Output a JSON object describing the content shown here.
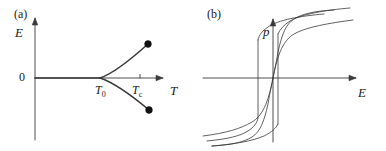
{
  "figure": {
    "width": 386,
    "height": 151,
    "background": "#ffffff",
    "stroke_color": "#3a3a3a",
    "text_color": "#1a1a1a"
  },
  "panels": [
    {
      "tag": "(a)",
      "tag_pos": [
        14,
        8
      ],
      "origin": [
        35,
        78
      ],
      "x_axis": {
        "label": "T",
        "label_pos": [
          170,
          84
        ],
        "start": [
          35,
          78
        ],
        "end": [
          163,
          78
        ],
        "arrow": true
      },
      "y_axis": {
        "label": "E",
        "label_pos": [
          15,
          26
        ],
        "start": [
          35,
          140
        ],
        "end": [
          35,
          18
        ],
        "arrow": true
      },
      "origin_label": "0",
      "origin_label_pos": [
        19,
        71
      ],
      "ticks": [
        {
          "label": "T",
          "sub": "0",
          "value_pos": [
            95,
            84
          ],
          "x": 100,
          "draw_mark": false
        },
        {
          "label": "T",
          "sub": "c",
          "value_pos": [
            132,
            84
          ],
          "x": 140,
          "draw_mark": true
        }
      ],
      "curves": {
        "trivial_branch": "M 35 78 L 100 78",
        "upper_branch": "M 100 78 C 112 74 128 62 148 44",
        "lower_branch": "M 100 78 C 112 82 130 94 149 110"
      },
      "endpoints": [
        {
          "name": "upper-branch-endpoint",
          "cx": 148,
          "cy": 44,
          "r": 3.4
        },
        {
          "name": "lower-branch-endpoint",
          "cx": 149,
          "cy": 110,
          "r": 3.4
        }
      ]
    },
    {
      "tag": "(b)",
      "tag_pos": [
        207,
        8
      ],
      "origin": [
        273,
        78
      ],
      "x_axis": {
        "label": "E",
        "label_pos": [
          358,
          86
        ],
        "start": [
          203,
          78
        ],
        "end": [
          356,
          78
        ],
        "arrow": true
      },
      "y_axis": {
        "label": "p",
        "label_pos": [
          263,
          25
        ],
        "start": [
          273,
          142
        ],
        "end": [
          273,
          19
        ],
        "arrow": true
      },
      "curves": [
        {
          "name": "hysteresis-curve-outer",
          "path": "M 203 136 C 226 133 240 129 252 122 C 262 116 268 104 273 78 C 278 52 284 40 294 34 C 306 27 330 23 353 20",
          "jump": null
        },
        {
          "name": "hysteresis-curve-middle",
          "path": "M 207 141 C 228 139 240 136 248 131 C 254 127 257 123 258 118 L 258 118 M 258 40 C 259 35 262 31 268 27 C 278 20 300 16 324 14",
          "jump": {
            "x": 258,
            "y_top": 40,
            "y_bottom": 118
          }
        },
        {
          "name": "hysteresis-curve-inner",
          "path": "M 212 146 C 236 144 252 141 264 136 C 272 132 276 128 278 124 L 278 124 M 278 34 C 280 29 284 25 290 21 C 302 14 326 10 350 8",
          "jump": {
            "x": 278,
            "y_top": 34,
            "y_bottom": 124
          }
        }
      ],
      "extra_curves": [
        {
          "name": "hysteresis-curve-steep-left",
          "path": "M 212 146 C 232 145 244 142 252 137 C 260 132 264 122 268 104 C 270 92 272 84 273 78"
        },
        {
          "name": "hysteresis-curve-steep-right",
          "path": "M 273 78 C 274 72 276 64 278 52 C 282 34 286 24 294 19 C 302 14 314 11 334 10"
        }
      ]
    }
  ]
}
